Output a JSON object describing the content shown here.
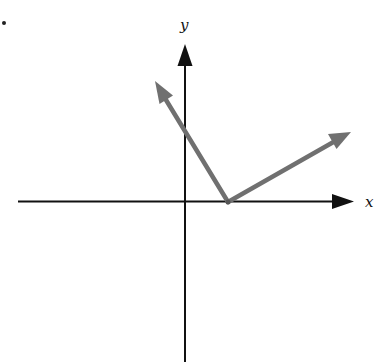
{
  "diagram": {
    "type": "coordinate-plane-vectors",
    "bullet": "•",
    "axes": {
      "x_label": "x",
      "y_label": "y",
      "color": "#111111"
    },
    "vectors": [
      {
        "name": "left-up-vector",
        "from": [
          228,
          202
        ],
        "to": [
          155,
          81
        ],
        "color": "#707070"
      },
      {
        "name": "right-up-vector",
        "from": [
          228,
          202
        ],
        "to": [
          351,
          132
        ],
        "color": "#707070"
      }
    ]
  }
}
